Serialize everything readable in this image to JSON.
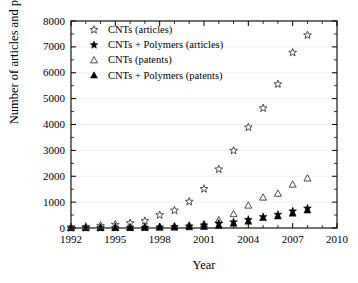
{
  "chart_data": {
    "type": "scatter",
    "title": "",
    "xlabel": "Year",
    "ylabel": "Number of articles and patents",
    "xlim": [
      1992,
      2010
    ],
    "ylim": [
      0,
      8000
    ],
    "xticks": [
      1992,
      1995,
      1998,
      2001,
      2004,
      2007,
      2010
    ],
    "xtick_labels": [
      "1992",
      "1995",
      "1998",
      "2001",
      "2004",
      "2007",
      "2010"
    ],
    "xtick_minor_step": 1,
    "yticks": [
      0,
      1000,
      2000,
      3000,
      4000,
      5000,
      6000,
      7000,
      8000
    ],
    "ytick_labels": [
      "0",
      "1000",
      "2000",
      "3000",
      "4000",
      "5000",
      "6000",
      "7000",
      "8000"
    ],
    "ytick_minor_step": 500,
    "grid": "horizontal-light",
    "legend_position": "top-left-inside",
    "frame": "box",
    "x": [
      1992,
      1993,
      1994,
      1995,
      1996,
      1997,
      1998,
      1999,
      2000,
      2001,
      2002,
      2003,
      2004,
      2005,
      2006,
      2007,
      2008
    ],
    "series": [
      {
        "name": "CNTs (articles)",
        "marker": "star-open",
        "values": [
          30,
          50,
          90,
          130,
          190,
          270,
          500,
          680,
          1020,
          1510,
          2270,
          2990,
          3890,
          4630,
          5560,
          6780,
          7450
        ]
      },
      {
        "name": "CNTs + Polymers (articles)",
        "marker": "star-filled",
        "values": [
          2,
          3,
          5,
          8,
          12,
          18,
          30,
          45,
          70,
          110,
          180,
          230,
          320,
          430,
          520,
          650,
          760
        ]
      },
      {
        "name": "CNTs (patents)",
        "marker": "triangle-open",
        "values": [
          5,
          8,
          12,
          18,
          25,
          35,
          50,
          70,
          100,
          150,
          300,
          540,
          870,
          1180,
          1330,
          1680,
          1920
        ]
      },
      {
        "name": "CNTs + Polymers (patents)",
        "marker": "triangle-filled",
        "values": [
          1,
          2,
          3,
          4,
          6,
          9,
          14,
          20,
          30,
          45,
          90,
          170,
          250,
          390,
          450,
          560,
          680
        ]
      }
    ]
  },
  "legend": {
    "entries": [
      {
        "label": "CNTs (articles)",
        "marker": "star-open"
      },
      {
        "label": "CNTs + Polymers (articles)",
        "marker": "star-filled"
      },
      {
        "label": "CNTs (patents)",
        "marker": "triangle-open"
      },
      {
        "label": "CNTs + Polymers (patents)",
        "marker": "triangle-filled"
      }
    ]
  },
  "colors": {
    "axis": "#000000",
    "text": "#000000",
    "grid": "#e9e9e9",
    "marker_open": "#3a3a3a",
    "marker_filled": "#000000",
    "background": "#ffffff"
  }
}
